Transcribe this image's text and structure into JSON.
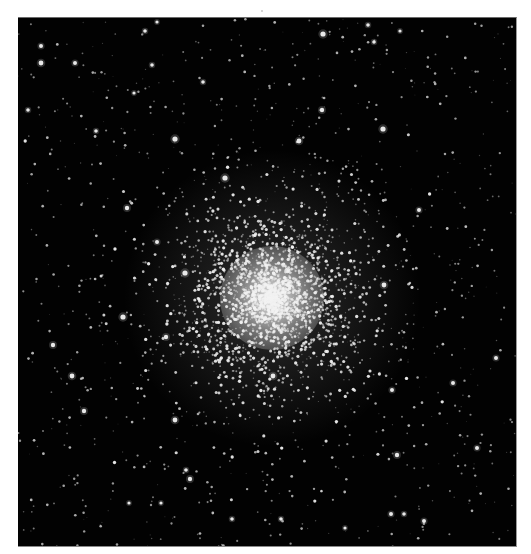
{
  "image": {
    "subject": "globular star cluster",
    "frame": {
      "x": 18,
      "y": 17,
      "width": 499,
      "height": 530
    },
    "background_color": "#020202",
    "page_background": "#ffffff",
    "cluster_center": {
      "x": 272,
      "y": 297
    },
    "halo": {
      "radius": 150,
      "color_inner": "rgba(200,200,200,0.22)",
      "color_outer": "rgba(0,0,0,0)"
    },
    "core": {
      "radius": 52,
      "color_inner": "rgba(238,238,238,0.95)",
      "color_mid": "rgba(200,200,200,0.55)",
      "color_outer": "rgba(120,120,120,0)"
    },
    "procedural_stars": {
      "seed": 7,
      "background_count": 900,
      "cluster_count": 2600,
      "cluster_sigma": 62,
      "star_color": "#f2f2f2"
    },
    "bright_stars": [
      {
        "x": 323,
        "y": 33,
        "r": 2.6
      },
      {
        "x": 175,
        "y": 138,
        "r": 2.6
      },
      {
        "x": 225,
        "y": 177,
        "r": 2.6
      },
      {
        "x": 383,
        "y": 128,
        "r": 2.6
      },
      {
        "x": 299,
        "y": 140,
        "r": 2.4
      },
      {
        "x": 322,
        "y": 109,
        "r": 2.2
      },
      {
        "x": 127,
        "y": 207,
        "r": 2.2
      },
      {
        "x": 123,
        "y": 316,
        "r": 2.6
      },
      {
        "x": 185,
        "y": 272,
        "r": 2.6
      },
      {
        "x": 53,
        "y": 344,
        "r": 2.2
      },
      {
        "x": 72,
        "y": 375,
        "r": 2.4
      },
      {
        "x": 157,
        "y": 241,
        "r": 2.0
      },
      {
        "x": 166,
        "y": 336,
        "r": 2.2
      },
      {
        "x": 84,
        "y": 410,
        "r": 2.2
      },
      {
        "x": 175,
        "y": 419,
        "r": 2.4
      },
      {
        "x": 190,
        "y": 478,
        "r": 2.2
      },
      {
        "x": 186,
        "y": 469,
        "r": 1.8
      },
      {
        "x": 273,
        "y": 375,
        "r": 2.4
      },
      {
        "x": 453,
        "y": 382,
        "r": 2.0
      },
      {
        "x": 392,
        "y": 389,
        "r": 2.0
      },
      {
        "x": 477,
        "y": 447,
        "r": 2.0
      },
      {
        "x": 397,
        "y": 454,
        "r": 2.2
      },
      {
        "x": 391,
        "y": 513,
        "r": 2.0
      },
      {
        "x": 384,
        "y": 284,
        "r": 2.4
      },
      {
        "x": 496,
        "y": 357,
        "r": 2.0
      },
      {
        "x": 419,
        "y": 209,
        "r": 2.0
      },
      {
        "x": 41,
        "y": 45,
        "r": 2.0
      },
      {
        "x": 41,
        "y": 62,
        "r": 2.4
      },
      {
        "x": 75,
        "y": 62,
        "r": 2.0
      },
      {
        "x": 145,
        "y": 30,
        "r": 1.8
      },
      {
        "x": 152,
        "y": 64,
        "r": 1.8
      },
      {
        "x": 157,
        "y": 21,
        "r": 1.6
      },
      {
        "x": 368,
        "y": 24,
        "r": 1.8
      },
      {
        "x": 374,
        "y": 41,
        "r": 1.8
      },
      {
        "x": 28,
        "y": 109,
        "r": 1.8
      },
      {
        "x": 96,
        "y": 130,
        "r": 1.8
      },
      {
        "x": 134,
        "y": 92,
        "r": 1.6
      },
      {
        "x": 203,
        "y": 81,
        "r": 1.8
      },
      {
        "x": 400,
        "y": 30,
        "r": 1.6
      },
      {
        "x": 232,
        "y": 518,
        "r": 1.8
      },
      {
        "x": 281,
        "y": 518,
        "r": 1.8
      },
      {
        "x": 345,
        "y": 527,
        "r": 1.6
      },
      {
        "x": 404,
        "y": 513,
        "r": 1.8
      },
      {
        "x": 424,
        "y": 520,
        "r": 2.0
      },
      {
        "x": 129,
        "y": 502,
        "r": 1.6
      },
      {
        "x": 161,
        "y": 502,
        "r": 1.6
      }
    ],
    "top_speck": {
      "x": 261,
      "y": 10
    }
  }
}
